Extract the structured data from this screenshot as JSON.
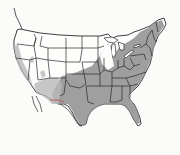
{
  "map": {
    "type": "range-map",
    "region": "Contiguous United States",
    "colors": {
      "background": "#fbfbfa",
      "land": "#fdfdfc",
      "range_dark": "#8e8e8e",
      "range_light": "#b9b9b9",
      "borders": "#2a2a2a",
      "mexico_border_accent": "#c04848"
    },
    "shaded_regions": [
      {
        "name": "Eastern and southern range",
        "description": "Southeastern US, Texas, Oklahoma, southern Great Plains, Midwest, Ohio Valley, Mid-Atlantic, Northeast into Maine"
      },
      {
        "name": "Southwest range",
        "description": "Southern Arizona, New Mexico, western Texas"
      },
      {
        "name": "Pacific coast range",
        "description": "Coastal and interior California, western Oregon"
      },
      {
        "name": "Isolated patches",
        "description": "Scattered interior western patches (Idaho/Nevada/Utah)"
      }
    ],
    "unshaded_regions": [
      "Northern Great Plains",
      "Northern Rockies",
      "Great Basin interior",
      "Upper Great Lakes (northern Michigan, Wisconsin, Minnesota)"
    ]
  }
}
